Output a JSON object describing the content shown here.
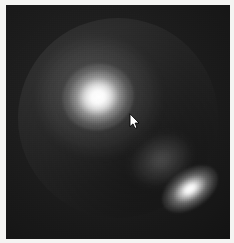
{
  "window": {
    "title": "Sphere Render",
    "frame_color": "#f4f4f2",
    "frame_label": "photo-border"
  },
  "scene": {
    "name": "3d-rendered-sphere",
    "background_color": "#1d1d1d",
    "width": 224,
    "height": 234,
    "description": "Dark scene containing a single rim-lit shaded sphere with specular highlights",
    "grain": "dithered render noise"
  },
  "sphere": {
    "label": "sphere",
    "center_x": 112,
    "center_y": 113,
    "radius": 100,
    "base_color": "#2a2a2a",
    "rim_color": "#ffffff",
    "shading": "diffuse + rim light"
  },
  "highlights": [
    {
      "name": "primary-specular-highlight",
      "center_x": 92,
      "center_y": 92,
      "width": 72,
      "height": 66,
      "rotation": -18,
      "color": "#ffffff",
      "intensity": "bright"
    },
    {
      "name": "secondary-specular-highlight",
      "center_x": 184,
      "center_y": 184,
      "width": 62,
      "height": 38,
      "rotation": -34,
      "color": "#ffffff",
      "intensity": "bright"
    },
    {
      "name": "tertiary-sheen",
      "center_x": 155,
      "center_y": 155,
      "width": 62,
      "height": 48,
      "rotation": -25,
      "color": "#ffffff",
      "intensity": "faint"
    }
  ],
  "cursor": {
    "name": "mouse-arrow-pointer",
    "x": 129,
    "y": 110,
    "color": "#ffffff",
    "outline_color": "#000000",
    "type": "arrow"
  }
}
